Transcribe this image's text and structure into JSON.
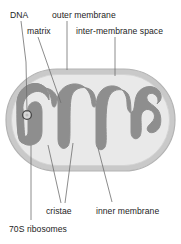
{
  "figure": {
    "background_color": "#ffffff"
  },
  "colors": {
    "outer_membrane_fill": "#c9c9c9",
    "outer_membrane_stroke": "#b0b0b0",
    "inter_membrane_space_fill": "#e8e8e8",
    "matrix_fill": "#8e8e8e",
    "dna_stroke": "#4a4a4a",
    "leader_line": "#6f6f6f",
    "text": "#1d1d1d"
  },
  "labels": [
    {
      "id": "dna",
      "text": "DNA",
      "x": 10,
      "y": 10
    },
    {
      "id": "outer-membrane",
      "text": "outer membrane",
      "x": 52,
      "y": 10
    },
    {
      "id": "matrix",
      "text": "matrix",
      "x": 27,
      "y": 26
    },
    {
      "id": "inter-membrane-space",
      "text": "inter-membrane space",
      "x": 76,
      "y": 26
    },
    {
      "id": "cristae",
      "text": "cristae",
      "x": 46,
      "y": 206
    },
    {
      "id": "inner-membrane",
      "text": "inner membrane",
      "x": 96,
      "y": 206
    },
    {
      "id": "70s-ribosomes",
      "text": "70S ribosomes",
      "x": 9,
      "y": 224
    }
  ],
  "leader_lines": [
    {
      "id": "dna-leader",
      "points": "21,21 26,60 27,115"
    },
    {
      "id": "outer-membrane-leader",
      "points": "67,21 67,70"
    },
    {
      "id": "matrix-leader",
      "points": "38,37 61,103"
    },
    {
      "id": "inter-membrane-space-leader",
      "points": "115,37 115,76"
    },
    {
      "id": "cristae-leader-left",
      "points": "61,203 48,145"
    },
    {
      "id": "cristae-leader-right",
      "points": "65,203 73,143"
    },
    {
      "id": "inner-membrane-leader",
      "points": "112,202 98,148"
    },
    {
      "id": "ribosomes-leader",
      "points": "31,220 31,145"
    }
  ],
  "structures": {
    "outer_membrane": {
      "name": "outer membrane",
      "shape": "rounded capsule",
      "bounds": {
        "x": 6,
        "y": 69,
        "width": 169,
        "height": 102,
        "radius": 51
      }
    },
    "inter_membrane_space": {
      "name": "inter-membrane space",
      "shape": "inner rounded capsule",
      "bounds": {
        "x": 11,
        "y": 74,
        "width": 159,
        "height": 92,
        "radius": 46
      }
    },
    "matrix": {
      "name": "matrix",
      "shape": "folded cristae blob"
    },
    "dna": {
      "name": "DNA",
      "shape": "small circle",
      "center": {
        "x": 27,
        "y": 115
      },
      "radius": 4.2
    }
  }
}
